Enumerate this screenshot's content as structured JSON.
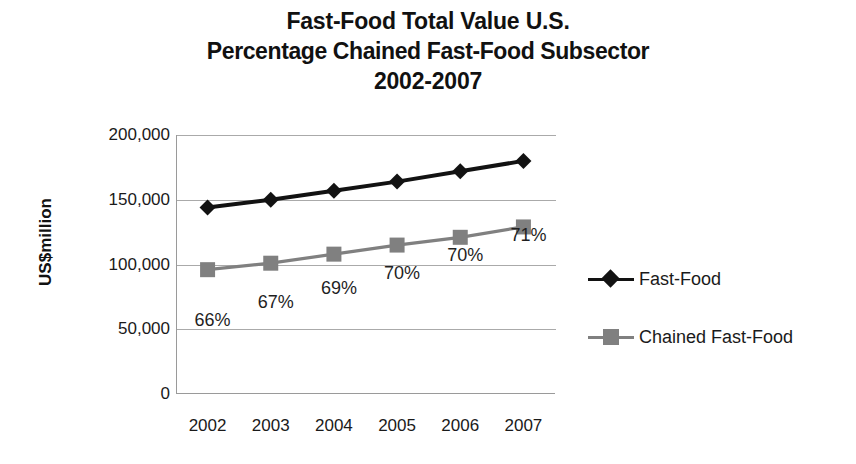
{
  "chart_data": {
    "type": "line",
    "title": "Fast-Food Total Value U.S. Percentage Chained Fast-Food Subsector 2002-2007",
    "title_lines": [
      "Fast-Food Total Value U.S.",
      "Percentage Chained Fast-Food Subsector",
      "2002-2007"
    ],
    "xlabel": "",
    "ylabel": "US$million",
    "categories": [
      "2002",
      "2003",
      "2004",
      "2005",
      "2006",
      "2007"
    ],
    "ylim": [
      0,
      200000
    ],
    "yticks": [
      0,
      50000,
      100000,
      150000,
      200000
    ],
    "ytick_labels": [
      "0",
      "50,000",
      "100,000",
      "150,000",
      "200,000"
    ],
    "grid": true,
    "legend_position": "right",
    "series": [
      {
        "name": "Fast-Food",
        "color": "#121212",
        "marker": "diamond",
        "values": [
          144000,
          150000,
          157000,
          164000,
          172000,
          180000
        ]
      },
      {
        "name": "Chained Fast-Food",
        "color": "#808080",
        "marker": "square",
        "values": [
          96000,
          101000,
          108000,
          115000,
          121000,
          129000
        ]
      }
    ],
    "annotations": [
      {
        "text": "66%",
        "category": "2002"
      },
      {
        "text": "67%",
        "category": "2003"
      },
      {
        "text": "69%",
        "category": "2004"
      },
      {
        "text": "70%",
        "category": "2005"
      },
      {
        "text": "70%",
        "category": "2006"
      },
      {
        "text": "71%",
        "category": "2007"
      }
    ]
  },
  "colors": {
    "fast_food": "#121212",
    "chained_fast_food": "#808080",
    "grid": "#aaaaaa",
    "axis": "#9a9a9a",
    "text": "#1a1a1a",
    "background": "#ffffff"
  }
}
